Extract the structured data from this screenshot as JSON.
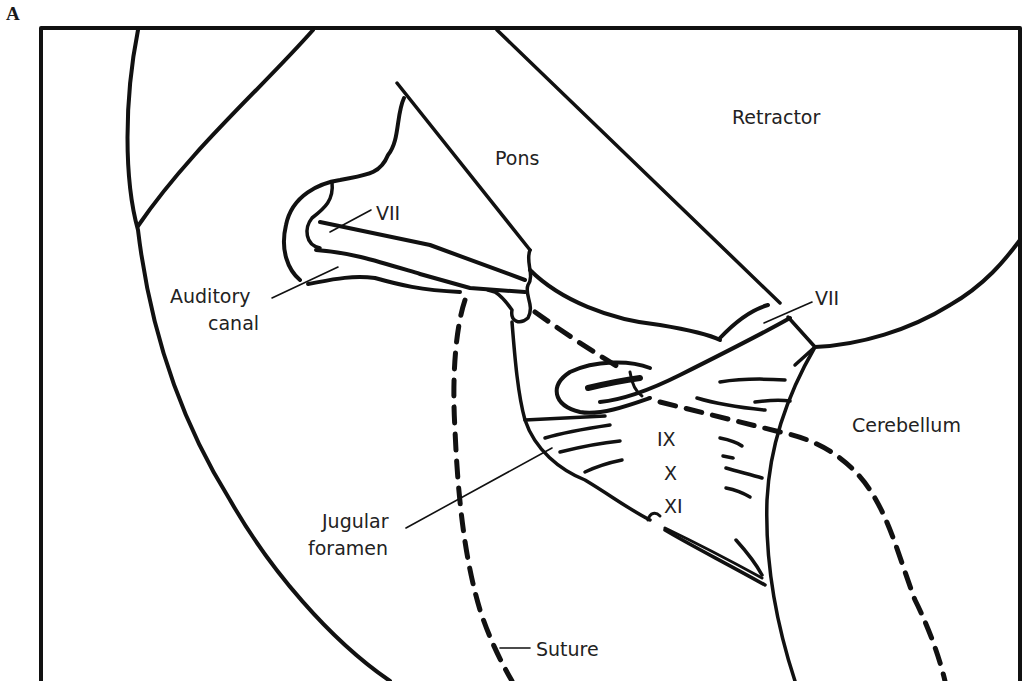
{
  "figure": {
    "panel_letter": "A",
    "colors": {
      "ink": "#111111",
      "background": "#ffffff"
    },
    "labels": {
      "retractor": "Retractor",
      "pons": "Pons",
      "vii_upper": "VII",
      "vii_lower": "VII",
      "auditory_line1": "Auditory",
      "auditory_line2": "canal",
      "cerebellum": "Cerebellum",
      "nerve_ix": "IX",
      "nerve_x": "X",
      "nerve_xi": "XI",
      "jugular_line1": "Jugular",
      "jugular_line2": "foramen",
      "suture": "Suture"
    }
  }
}
